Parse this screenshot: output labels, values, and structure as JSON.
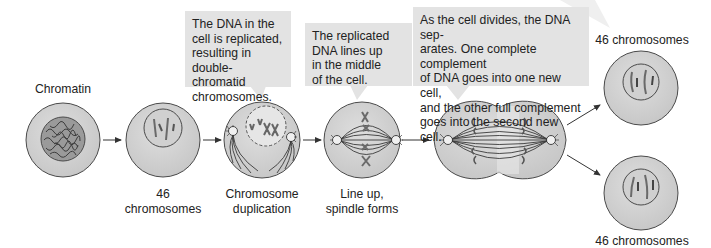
{
  "figure": {
    "colors": {
      "cell_fill": "#d4d4d4",
      "cell_stroke": "#4a4a4a",
      "nucleus_fill": "#dcdcdc",
      "chromosome": "#6a6a6a",
      "callout_bg": "#e3e3e3",
      "arrow": "#333333",
      "text": "#222222"
    }
  },
  "callouts": [
    {
      "id": "replication",
      "text_lines": [
        "The DNA in the",
        "cell is replicated,",
        "resulting in",
        "double-chromatid",
        "chromosomes."
      ]
    },
    {
      "id": "line-up",
      "text_lines": [
        "The replicated",
        "DNA lines up",
        "in the middle",
        "of the cell."
      ]
    },
    {
      "id": "division",
      "text_lines": [
        "As the cell divides, the DNA sep-",
        "arates. One complete complement",
        "of DNA goes into one new cell,",
        "and the other full complement",
        "goes into the second new cell."
      ]
    }
  ],
  "stages": [
    {
      "id": "chromatin",
      "label_lines": [
        "Chromatin"
      ]
    },
    {
      "id": "46-chromosomes",
      "label_lines": [
        "46",
        "chromosomes"
      ]
    },
    {
      "id": "chromosome-duplication",
      "label_lines": [
        "Chromosome",
        "duplication"
      ]
    },
    {
      "id": "line-up-spindle",
      "label_lines": [
        "Line up,",
        "spindle forms"
      ]
    },
    {
      "id": "dividing-cell",
      "label_lines": []
    },
    {
      "id": "daughter-cell-top",
      "label_lines": [
        "46 chromosomes"
      ]
    },
    {
      "id": "daughter-cell-bottom",
      "label_lines": [
        "46 chromosomes"
      ]
    }
  ]
}
